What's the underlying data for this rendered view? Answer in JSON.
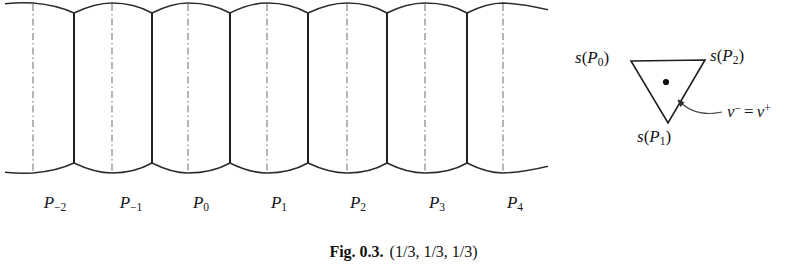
{
  "figure": {
    "caption_label": "Fig. 0.3.",
    "caption_text": "(1/3, 1/3, 1/3)",
    "background_color": "#ffffff",
    "stroke_color": "#2b2b2b",
    "centerline_color": "#9a9a9a"
  },
  "tiling": {
    "description": "periodic barrel-shaped fundamental domains",
    "cell_count": 7,
    "cells": [
      {
        "label": "P",
        "index": "−2",
        "label_text": "P−2",
        "center_x": 33,
        "label_x": 55,
        "label_y": 200
      },
      {
        "label": "P",
        "index": "−1",
        "label_text": "P−1",
        "center_x": 112,
        "label_x": 131,
        "label_y": 200
      },
      {
        "label": "P",
        "index": "0",
        "label_text": "P0",
        "center_x": 188,
        "label_x": 201,
        "label_y": 200
      },
      {
        "label": "P",
        "index": "1",
        "label_text": "P1",
        "center_x": 267,
        "label_x": 279,
        "label_y": 200
      },
      {
        "label": "P",
        "index": "2",
        "label_text": "P2",
        "center_x": 347,
        "label_x": 358,
        "label_y": 200
      },
      {
        "label": "P",
        "index": "3",
        "label_text": "P3",
        "center_x": 425,
        "label_x": 437,
        "label_y": 200
      },
      {
        "label": "P",
        "index": "4",
        "label_text": "P4",
        "center_x": 503,
        "label_x": 515,
        "label_y": 200
      }
    ],
    "boundaries_x": [
      74,
      152,
      230,
      308,
      387,
      467
    ],
    "clip_left_x": 5,
    "clip_right_x": 548,
    "top_line_y": 13,
    "bottom_line_y": 163,
    "arc_peak_top_y": 3,
    "arc_peak_bottom_y": 175
  },
  "triangle": {
    "vertices": [
      {
        "name": "s(P0)",
        "x": 71,
        "y": 31
      },
      {
        "name": "s(P2)",
        "x": 145,
        "y": 30
      },
      {
        "name": "s(P1)",
        "x": 108,
        "y": 93
      }
    ],
    "interior_point": {
      "x": 106,
      "y": 52
    },
    "labels": {
      "vertex_0": {
        "s": "s",
        "open": "(",
        "var": "P",
        "sub": "0",
        "close": ")",
        "x": 15,
        "y": 21
      },
      "vertex_2": {
        "s": "s",
        "open": "(",
        "var": "P",
        "sub": "2",
        "close": ")",
        "x": 150,
        "y": 20
      },
      "vertex_1": {
        "s": "s",
        "open": "(",
        "var": "P",
        "sub": "1",
        "close": ")",
        "x": 77,
        "y": 97
      },
      "point_label": {
        "nu": "ν",
        "minus": "−",
        "eq": "=",
        "plus": "+",
        "text": "ν− = ν+",
        "x": 168,
        "y": 74
      }
    }
  }
}
